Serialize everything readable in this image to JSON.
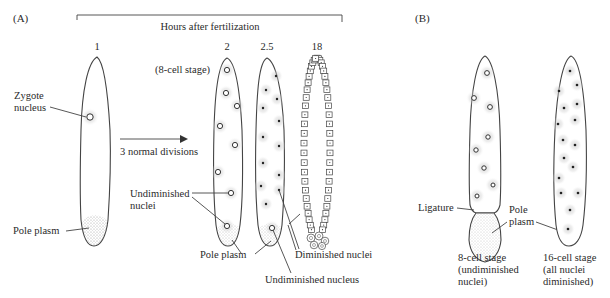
{
  "panels": {
    "a_label": "(A)",
    "b_label": "(B)"
  },
  "timeline": {
    "header": "Hours after fertilization",
    "times": [
      "1",
      "2",
      "2.5",
      "18"
    ]
  },
  "panel_a": {
    "zygote_nucleus_line1": "Zygote",
    "zygote_nucleus_line2": "nucleus",
    "pole_plasm": "Pole plasm",
    "eight_cell_stage": "(8-cell stage)",
    "arrow_label": "3 normal divisions",
    "undiminished_nuclei_line1": "Undiminished",
    "undiminished_nuclei_line2": "nuclei",
    "pole_plasm_2": "Pole plasm",
    "diminished_nuclei": "Diminished nuclei",
    "undiminished_nucleus": "Undiminished nucleus"
  },
  "panel_b": {
    "ligature": "Ligature",
    "pole_plasm_line1": "Pole",
    "pole_plasm_line2": "plasm",
    "left_caption_line1": "8-cell stage",
    "left_caption_line2": "(undiminished",
    "left_caption_line3": "nuclei)",
    "right_caption_line1": "16-cell stage",
    "right_caption_line2": "(all nuclei",
    "right_caption_line3": "diminished)"
  },
  "colors": {
    "ink": "#2a2a2a",
    "background": "#ffffff"
  }
}
